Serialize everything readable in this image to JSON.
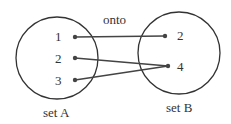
{
  "title": "onto",
  "setA": {
    "label": "set A",
    "elements": [
      {
        "label": "1",
        "x": 75,
        "y": 37
      },
      {
        "label": "2",
        "x": 75,
        "y": 58
      },
      {
        "label": "3",
        "x": 75,
        "y": 80
      }
    ]
  },
  "setB": {
    "label": "set B",
    "elements": [
      {
        "label": "2",
        "x": 165,
        "y": 36
      },
      {
        "label": "4",
        "x": 168,
        "y": 66
      }
    ]
  },
  "mappings": [
    {
      "from": "1",
      "to": "2"
    },
    {
      "from": "2",
      "to": "4"
    },
    {
      "from": "3",
      "to": "4"
    }
  ]
}
